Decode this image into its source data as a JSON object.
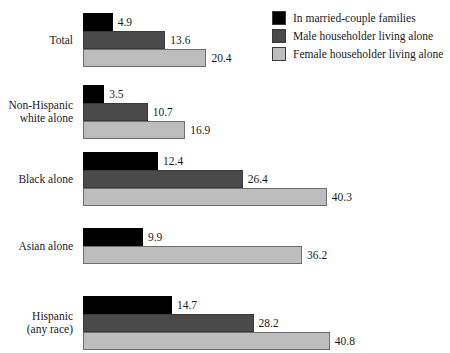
{
  "chart_data": {
    "type": "bar",
    "orientation": "horizontal",
    "title": "",
    "xlabel": "",
    "ylabel": "",
    "grid": false,
    "legend_position": "top-right",
    "xlim": [
      0,
      40.8
    ],
    "categories": [
      "Total",
      "Non-Hispanic\nwhite alone",
      "Black alone",
      "Asian alone",
      "Hispanic\n(any race)"
    ],
    "series": [
      {
        "name": "In married-couple families",
        "color": "#000000",
        "values": [
          4.9,
          3.5,
          12.4,
          9.9,
          14.7
        ]
      },
      {
        "name": "Male householder living alone",
        "color": "#4a4a4a",
        "values": [
          13.6,
          10.7,
          26.4,
          null,
          28.2
        ]
      },
      {
        "name": "Female householder living alone",
        "color": "#bdbdbd",
        "values": [
          20.4,
          16.9,
          40.3,
          36.2,
          40.8
        ]
      }
    ],
    "groups": [
      {
        "category": "Total",
        "bars": [
          {
            "series": "In married-couple families",
            "value": 4.9,
            "label": "4.9"
          },
          {
            "series": "Male householder living alone",
            "value": 13.6,
            "label": "13.6"
          },
          {
            "series": "Female householder living alone",
            "value": 20.4,
            "label": "20.4"
          }
        ]
      },
      {
        "category": "Non-Hispanic\nwhite alone",
        "bars": [
          {
            "series": "In married-couple families",
            "value": 3.5,
            "label": "3.5"
          },
          {
            "series": "Male householder living alone",
            "value": 10.7,
            "label": "10.7"
          },
          {
            "series": "Female householder living alone",
            "value": 16.9,
            "label": "16.9"
          }
        ]
      },
      {
        "category": "Black alone",
        "bars": [
          {
            "series": "In married-couple families",
            "value": 12.4,
            "label": "12.4"
          },
          {
            "series": "Male householder living alone",
            "value": 26.4,
            "label": "26.4"
          },
          {
            "series": "Female householder living alone",
            "value": 40.3,
            "label": "40.3"
          }
        ]
      },
      {
        "category": "Asian alone",
        "bars": [
          {
            "series": "In married-couple families",
            "value": 9.9,
            "label": "9.9"
          },
          {
            "series": "Female householder living alone",
            "value": 36.2,
            "label": "36.2"
          }
        ]
      },
      {
        "category": "Hispanic\n(any race)",
        "bars": [
          {
            "series": "In married-couple families",
            "value": 14.7,
            "label": "14.7"
          },
          {
            "series": "Male householder living alone",
            "value": 28.2,
            "label": "28.2"
          },
          {
            "series": "Female householder living alone",
            "value": 40.8,
            "label": "40.8"
          }
        ]
      }
    ]
  },
  "legend": {
    "items": [
      {
        "label": "In married-couple families",
        "color": "#000000",
        "swatch": "black-swatch"
      },
      {
        "label": "Male householder living alone",
        "color": "#4a4a4a",
        "swatch": "dark-gray-swatch"
      },
      {
        "label": "Female householder living alone",
        "color": "#bdbdbd",
        "swatch": "light-gray-swatch"
      }
    ]
  },
  "layout": {
    "bar_origin_x": 83,
    "px_per_unit": 6.05,
    "bar_height": 18,
    "group_tops": [
      13,
      85,
      152,
      228,
      296
    ]
  }
}
